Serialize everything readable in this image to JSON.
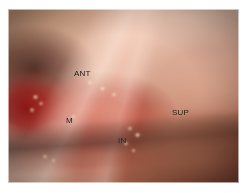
{
  "figure": {
    "kind": "intraoperative-surgical-photograph",
    "frame": {
      "background_color": "#ffffff",
      "border_color": "#ffffff"
    }
  },
  "annotations": [
    {
      "id": "ant",
      "label": "ANT",
      "meaning": "anterior",
      "color": "#151210"
    },
    {
      "id": "m",
      "label": "M",
      "meaning": "medial",
      "color": "#151210"
    },
    {
      "id": "sup",
      "label": "SUP",
      "meaning": "superior",
      "color": "#151210"
    },
    {
      "id": "in",
      "label": "IN",
      "meaning": "inferior",
      "color": "#151210"
    }
  ],
  "palette": {
    "pale_skin": "#e9c6b1",
    "skin_mid": "#d8a38d",
    "tan": "#c09073",
    "raw_tissue": "#ce5440",
    "deep_blood": "#8e0e0e",
    "dark_shadow": "#3a1812",
    "brown_lower": "#966a4a",
    "highlight": "#fffce2"
  }
}
